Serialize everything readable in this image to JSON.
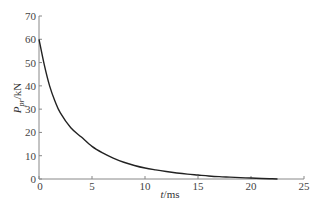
{
  "chart_data": {
    "type": "line",
    "title": "",
    "xlabel": "t/ms",
    "xlabel_italic": "t",
    "xlabel_unit": "/ms",
    "ylabel": "P_pr/kN",
    "ylabel_main": "P",
    "ylabel_sub": "pr",
    "ylabel_unit": "/kN",
    "xlim": [
      0,
      25
    ],
    "ylim": [
      0,
      70
    ],
    "xticks": [
      0,
      5,
      10,
      15,
      20,
      25
    ],
    "yticks": [
      0,
      10,
      20,
      30,
      40,
      50,
      60,
      70
    ],
    "grid": false,
    "legend": null,
    "series": [
      {
        "name": "P_pr",
        "color": "#222222",
        "x": [
          0,
          0.5,
          1,
          1.5,
          2,
          3,
          4,
          5,
          6,
          7,
          8,
          9,
          10,
          11,
          12,
          13,
          14,
          15,
          16,
          17,
          18,
          19,
          20,
          21,
          22,
          22.5
        ],
        "y": [
          60,
          49,
          40,
          33.5,
          28.5,
          22,
          18,
          14,
          11.2,
          9,
          7.2,
          5.8,
          4.7,
          3.9,
          3.2,
          2.6,
          2.1,
          1.7,
          1.3,
          1.0,
          0.8,
          0.6,
          0.4,
          0.2,
          0.08,
          0
        ]
      }
    ]
  },
  "colors": {
    "axis": "#888888",
    "line": "#222222",
    "text": "#444444"
  }
}
